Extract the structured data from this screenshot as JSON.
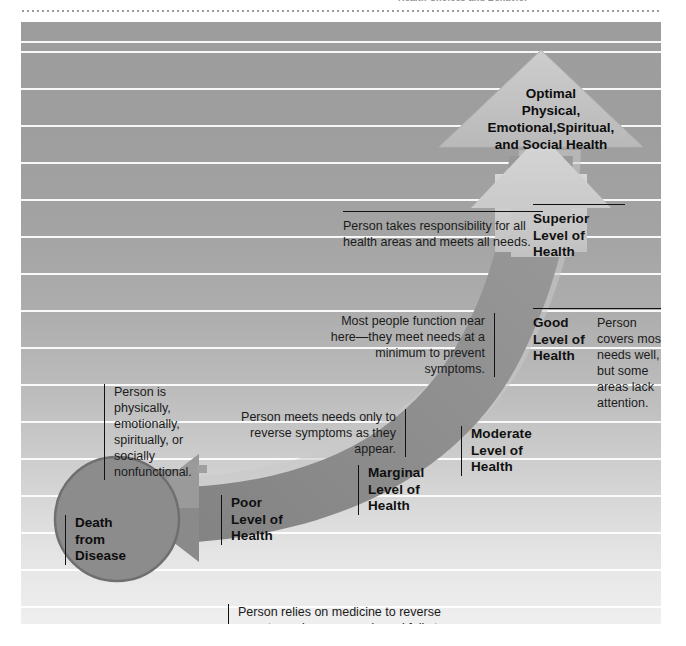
{
  "page": {
    "top_cropped_text": "Health Choices and Behavior",
    "background_note": "striped gradient panel"
  },
  "diagram": {
    "type": "health-continuum-arrow",
    "apex": {
      "name": "optimal-health-triangle",
      "label": "Optimal\nPhysical,\nEmotional,Spiritual,\nand Social Health",
      "lines": [
        "Optimal",
        "Physical,",
        "Emotional,Spiritual,",
        "and Social Health"
      ]
    },
    "terminus": {
      "name": "death-circle",
      "lines": [
        "Death",
        "from",
        "Disease"
      ]
    },
    "levels": [
      {
        "id": "superior",
        "lines": [
          "Superior",
          "Level of",
          "Health"
        ]
      },
      {
        "id": "good",
        "lines": [
          "Good",
          "Level of",
          "Health"
        ]
      },
      {
        "id": "moderate",
        "lines": [
          "Moderate",
          "Level of",
          "Health"
        ]
      },
      {
        "id": "marginal",
        "lines": [
          "Marginal",
          "Level of",
          "Health"
        ]
      },
      {
        "id": "poor",
        "lines": [
          "Poor",
          "Level of",
          "Health"
        ]
      }
    ],
    "callouts": [
      {
        "id": "superior-callout",
        "text": "Person takes responsibility for all health areas and meets all needs.",
        "align": "left"
      },
      {
        "id": "good-callout",
        "text": "Person covers most needs well, but some areas lack attention.",
        "align": "left"
      },
      {
        "id": "moderate-callout",
        "text": "Most people function near here—they meet needs at a minimum to prevent symptoms.",
        "align": "right"
      },
      {
        "id": "marginal-callout",
        "text": "Person meets needs only to reverse symptoms as they appear.",
        "align": "right"
      },
      {
        "id": "poor-callout",
        "text": "Person relies on medicine to reverse symptoms; ignores needs and fails to meet them.",
        "align": "left"
      },
      {
        "id": "death-callout",
        "text": "Person is physically, emotionally, spiritually, or socially nonfunctional.",
        "align": "left"
      }
    ],
    "colors": {
      "arrow_fill": "#8e8e8e",
      "arrow_highlight": "#c9c9c9",
      "triangle_fill": "#c4c4c4",
      "circle_fill": "#8c8c8c",
      "background_top": "#9d9d9d",
      "background_bottom": "#efefef",
      "rule_color": "#ffffff",
      "text_color": "#101010"
    }
  }
}
